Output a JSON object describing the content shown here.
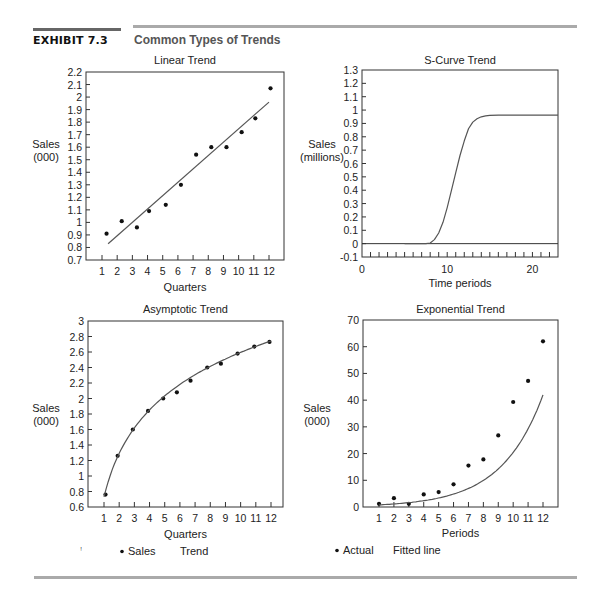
{
  "header": {
    "exhibit_label": "EXHIBIT 7.3",
    "title": "Common Types of Trends"
  },
  "chart_data": [
    {
      "id": "linear",
      "type": "scatter",
      "title": "Linear Trend",
      "xlabel": "Quarters",
      "ylabel": [
        "Sales",
        "(000)"
      ],
      "xlim": [
        0,
        13
      ],
      "ylim": [
        0.7,
        2.2
      ],
      "x_ticks": [
        1,
        2,
        3,
        4,
        5,
        6,
        7,
        8,
        9,
        10,
        11,
        12
      ],
      "x_tick_labels": [
        "1",
        "2",
        "3",
        "4",
        "5",
        "6",
        "7",
        "8",
        "9",
        "10",
        "11",
        "12"
      ],
      "y_ticks": [
        0.7,
        0.8,
        0.9,
        1,
        1.1,
        1.2,
        1.3,
        1.4,
        1.5,
        1.6,
        1.7,
        1.8,
        1.9,
        2,
        2.1,
        2.2
      ],
      "y_tick_labels": [
        "0.7",
        "0.8",
        "0.9",
        "1",
        "1.1",
        "1.2",
        "1.3",
        "1.4",
        "1.5",
        "1.6",
        "1.7",
        "1.8",
        "1.9",
        "2",
        "2.1",
        "2.2"
      ],
      "series": [
        {
          "name": "Sales",
          "kind": "points",
          "x": [
            1.3,
            2.3,
            3.3,
            4.1,
            5.2,
            6.2,
            7.2,
            8.2,
            9.2,
            10.2,
            11.1,
            12.1
          ],
          "y": [
            0.91,
            1.01,
            0.96,
            1.09,
            1.14,
            1.3,
            1.54,
            1.6,
            1.6,
            1.72,
            1.83,
            2.07
          ]
        },
        {
          "name": "Trend",
          "kind": "line",
          "x": [
            1.4,
            12.0
          ],
          "y": [
            0.83,
            1.96
          ]
        }
      ],
      "grid": false
    },
    {
      "id": "scurve",
      "type": "line",
      "title": "S-Curve Trend",
      "xlabel": "Time periods",
      "ylabel": [
        "Sales",
        "(millions)"
      ],
      "xlim": [
        0,
        23
      ],
      "ylim": [
        -0.1,
        1.3
      ],
      "x_ticks": [
        0,
        10,
        20
      ],
      "x_tick_labels": [
        "0",
        "10",
        "20"
      ],
      "x_minor_ticks": [
        1,
        2,
        3,
        4,
        5,
        6,
        7,
        8,
        9,
        10,
        11,
        12,
        13,
        14,
        15,
        16,
        17,
        18,
        19,
        20,
        21,
        22
      ],
      "y_ticks": [
        -0.1,
        0,
        0.1,
        0.2,
        0.3,
        0.4,
        0.5,
        0.6,
        0.7,
        0.8,
        0.9,
        1,
        1.1,
        1.2,
        1.3
      ],
      "y_tick_labels": [
        "-0.1",
        "0",
        "0.1",
        "0.2",
        "0.3",
        "0.4",
        "0.5",
        "0.6",
        "0.7",
        "0.8",
        "0.9",
        "1",
        "1.1",
        "1.2",
        "1.3"
      ],
      "baseline": 0,
      "series": [
        {
          "name": "S-curve",
          "kind": "line",
          "x": [
            5,
            6,
            7,
            7.5,
            8,
            8.5,
            9,
            9.5,
            10,
            10.5,
            11,
            11.5,
            12,
            12.5,
            13,
            13.5,
            14,
            14.5,
            15,
            16,
            17,
            18,
            19,
            20,
            21,
            22,
            23
          ],
          "y": [
            0,
            0,
            0,
            0,
            0.005,
            0.03,
            0.08,
            0.16,
            0.27,
            0.4,
            0.53,
            0.66,
            0.77,
            0.86,
            0.91,
            0.935,
            0.95,
            0.957,
            0.96,
            0.962,
            0.962,
            0.962,
            0.962,
            0.962,
            0.962,
            0.962,
            0.962
          ]
        }
      ],
      "grid": false
    },
    {
      "id": "asymptotic",
      "type": "scatter",
      "title": "Asymptotic Trend",
      "xlabel": "Quarters",
      "ylabel": [
        "Sales",
        "(000)"
      ],
      "xlim": [
        0,
        13
      ],
      "ylim": [
        0.6,
        3
      ],
      "x_ticks": [
        1,
        2,
        3,
        4,
        5,
        6,
        7,
        8,
        9,
        10,
        11,
        12
      ],
      "x_tick_labels": [
        "1",
        "2",
        "3",
        "4",
        "5",
        "6",
        "7",
        "8",
        "9",
        "10",
        "11",
        "12"
      ],
      "y_ticks": [
        0.6,
        0.8,
        1,
        1.2,
        1.4,
        1.6,
        1.8,
        2,
        2.2,
        2.4,
        2.6,
        2.8,
        3
      ],
      "y_tick_labels": [
        "0.6",
        "0.8",
        "1",
        "1.2",
        "1.4",
        "1.6",
        "1.8",
        "2",
        "2.2",
        "2.4",
        "2.6",
        "2.8",
        "3"
      ],
      "series": [
        {
          "name": "Sales",
          "kind": "points",
          "x": [
            1.1,
            1.9,
            2.9,
            3.9,
            4.9,
            5.8,
            6.7,
            7.8,
            8.7,
            9.8,
            10.9,
            11.9
          ],
          "y": [
            0.76,
            1.26,
            1.6,
            1.84,
            2.0,
            2.08,
            2.23,
            2.4,
            2.45,
            2.58,
            2.67,
            2.73
          ]
        },
        {
          "name": "Trend",
          "kind": "curve",
          "a": 0.73,
          "b": 0.81,
          "x_from": 1.0,
          "x_to": 12.0
        }
      ],
      "legend": [
        "Sales",
        "Trend"
      ],
      "grid": false
    },
    {
      "id": "exponential",
      "type": "scatter",
      "title": "Exponential Trend",
      "xlabel": "Periods",
      "ylabel": [
        "Sales",
        "(000)"
      ],
      "xlim": [
        0,
        13
      ],
      "ylim": [
        0,
        70
      ],
      "x_ticks": [
        1,
        2,
        3,
        4,
        5,
        6,
        7,
        8,
        9,
        10,
        11,
        12
      ],
      "x_tick_labels": [
        "1",
        "2",
        "3",
        "4",
        "5",
        "6",
        "7",
        "8",
        "9",
        "10",
        "11",
        "12"
      ],
      "y_ticks": [
        0,
        10,
        20,
        30,
        40,
        50,
        60,
        70
      ],
      "y_tick_labels": [
        "0",
        "10",
        "20",
        "30",
        "40",
        "50",
        "60",
        "70"
      ],
      "series": [
        {
          "name": "Actual",
          "kind": "points",
          "x": [
            1,
            2,
            3,
            4,
            5,
            6,
            7,
            8,
            9,
            10,
            11,
            12
          ],
          "y": [
            1.2,
            3.3,
            1.2,
            4.7,
            5.6,
            8.5,
            15.5,
            17.8,
            26.8,
            39.3,
            47.2,
            62.0
          ]
        },
        {
          "name": "Fitted line",
          "kind": "curve",
          "x_from": 1,
          "x_to": 12,
          "y0": 0.8,
          "exp": 3.15
        }
      ],
      "legend": [
        "Actual",
        "Fitted line"
      ],
      "grid": false
    }
  ],
  "legends": {
    "left": {
      "dot_label": "Sales",
      "line_label": "Trend"
    },
    "right": {
      "dot_label": "Actual",
      "line_label": "Fitted line"
    },
    "stray_mark": "!"
  }
}
